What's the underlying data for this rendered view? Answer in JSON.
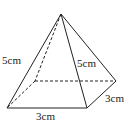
{
  "diagram": {
    "type": "square-pyramid",
    "labels": {
      "slant_left": "5cm",
      "slant_front": "5cm",
      "base_right": "3cm",
      "base_front": "3cm"
    },
    "vertices": {
      "apex": [
        61,
        14
      ],
      "front_left": [
        7,
        108
      ],
      "front_right": [
        87,
        108
      ],
      "back_right": [
        116,
        81
      ],
      "back_left": [
        35,
        81
      ]
    },
    "colors": {
      "stroke": "#222222",
      "background": "#ffffff"
    }
  }
}
